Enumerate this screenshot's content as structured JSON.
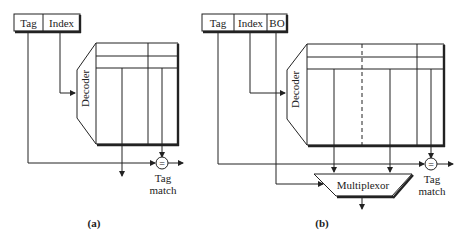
{
  "diagram_a": {
    "caption": "(a)",
    "address_fields": [
      "Tag",
      "Index"
    ],
    "decoder_label": "Decoder",
    "comparator_symbol": "=",
    "comparator_label_line1": "Tag",
    "comparator_label_line2": "match"
  },
  "diagram_b": {
    "caption": "(b)",
    "address_fields": [
      "Tag",
      "Index",
      "BO"
    ],
    "decoder_label": "Decoder",
    "multiplexor_label": "Multiplexor",
    "comparator_symbol": "=",
    "comparator_label_line1": "Tag",
    "comparator_label_line2": "match"
  }
}
